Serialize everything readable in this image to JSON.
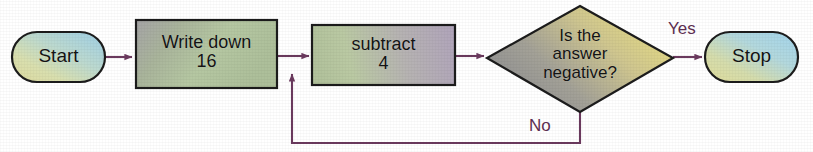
{
  "diagram": {
    "type": "flowchart",
    "background_color": "#ffffff",
    "connector_color": "#6b3a5e",
    "node_text_color": "#141414",
    "edge_label_color": "#5e2f52",
    "nodes": [
      {
        "id": "start",
        "shape": "terminal",
        "label": "Start",
        "gradient_from": "#e8e7a8",
        "gradient_to": "#9fd2e6"
      },
      {
        "id": "write-down-16",
        "shape": "process",
        "label": "Write down\n16",
        "line1": "Write down",
        "line2": "16",
        "gradient_from": "#a9a7a9",
        "gradient_to": "#b8cda0"
      },
      {
        "id": "subtract-4",
        "shape": "process",
        "label": "subtract\n4",
        "line1": "subtract",
        "line2": "4",
        "gradient_from": "#b6c79f",
        "gradient_to": "#b3a8bd"
      },
      {
        "id": "is-answer-negative",
        "shape": "decision",
        "label": "Is the\nanswer\nnegative?",
        "line1": "Is the",
        "line2": "answer",
        "line3": "negative?",
        "gradient_from": "#9a9a9a",
        "gradient_to": "#e9dd84"
      },
      {
        "id": "stop",
        "shape": "terminal",
        "label": "Stop",
        "gradient_from": "#e6e4a4",
        "gradient_to": "#a7d6ea"
      }
    ],
    "edges": [
      {
        "id": "start-to-write",
        "from": "start",
        "to": "write-down-16",
        "label": ""
      },
      {
        "id": "write-to-subtract",
        "from": "write-down-16",
        "to": "subtract-4",
        "label": ""
      },
      {
        "id": "subtract-to-decision",
        "from": "subtract-4",
        "to": "is-answer-negative",
        "label": ""
      },
      {
        "id": "decision-yes-to-stop",
        "from": "is-answer-negative",
        "to": "stop",
        "label": "Yes"
      },
      {
        "id": "decision-no-to-subtract",
        "from": "is-answer-negative",
        "to": "subtract-4",
        "label": "No"
      }
    ]
  }
}
